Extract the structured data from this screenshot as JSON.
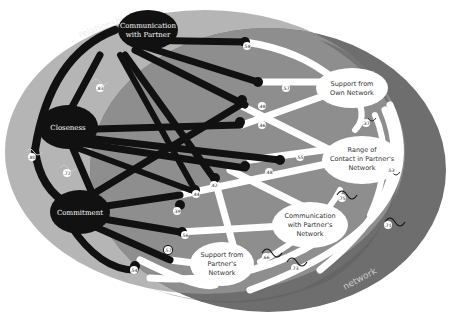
{
  "regions": {
    "relationship": {
      "label": "relationship",
      "color": "#b5b5b5"
    },
    "network": {
      "label": "network",
      "color": "#6e6e6e"
    },
    "overlap_color": "#8e8e8e"
  },
  "colors": {
    "relationship_link": "#111111",
    "network_link": "#ffffff",
    "background": "#ffffff"
  },
  "relationship_nodes": [
    {
      "id": "comm_partner",
      "label_lines": [
        "Communication",
        "with Partner"
      ]
    },
    {
      "id": "closeness",
      "label_lines": [
        "Closeness"
      ]
    },
    {
      "id": "commitment",
      "label_lines": [
        "Commitment"
      ]
    }
  ],
  "network_nodes": [
    {
      "id": "support_own",
      "label_lines": [
        "Support from",
        "Own Network"
      ]
    },
    {
      "id": "range_contact",
      "label_lines": [
        "Range of",
        "Contact in Partner's",
        "Network"
      ]
    },
    {
      "id": "comm_network",
      "label_lines": [
        "Communication",
        "with Partner's",
        "Network"
      ]
    },
    {
      "id": "support_partner",
      "label_lines": [
        "Support from",
        "Partner's",
        "Network"
      ]
    }
  ],
  "cross_correlations": [
    {
      "from": "comm_partner",
      "to": "support_own",
      "value": ".58"
    },
    {
      "from": "comm_partner",
      "to": "range_contact",
      "value": ".48"
    },
    {
      "from": "comm_partner",
      "to": "comm_network",
      "value": ".42"
    },
    {
      "from": "comm_partner",
      "to": "support_partner",
      "value": ".44"
    },
    {
      "from": "closeness",
      "to": "support_own",
      "value": ".57"
    },
    {
      "from": "closeness",
      "to": "range_contact",
      "value": ".55"
    },
    {
      "from": "closeness",
      "to": "comm_network",
      "value": ".48"
    },
    {
      "from": "closeness",
      "to": "support_partner",
      "value": ".46"
    },
    {
      "from": "commitment",
      "to": "support_own",
      "value": ".39"
    },
    {
      "from": "commitment",
      "to": "range_contact",
      "value": ".56"
    },
    {
      "from": "commitment",
      "to": "comm_network",
      "value": ".57"
    },
    {
      "from": "commitment",
      "to": "support_partner",
      "value": ".54"
    }
  ],
  "within_relationship": [
    {
      "from": "comm_partner",
      "to": "closeness",
      "value": ".83"
    },
    {
      "from": "comm_partner",
      "to": "commitment",
      "value": ".80"
    },
    {
      "from": "closeness",
      "to": "commitment",
      "value": ".72"
    }
  ],
  "within_network": [
    {
      "from": "support_own",
      "to": "range_contact",
      "value": ".37"
    },
    {
      "from": "support_own",
      "to": "comm_network",
      "value": ".53"
    },
    {
      "from": "range_contact",
      "to": "comm_network",
      "value": ".75"
    },
    {
      "from": "support_own",
      "to": "support_partner",
      "value": ".71"
    },
    {
      "from": "comm_network",
      "to": "support_partner",
      "value": ".66"
    },
    {
      "from": "range_contact",
      "to": "support_partner",
      "value": ".73"
    }
  ],
  "badges": {
    "b1": ".58",
    "b2": ".57",
    "b3": ".48",
    "b4": ".46",
    "b5": ".55",
    "b6": ".48",
    "b7": ".42",
    "b8": ".44",
    "b9": ".39",
    "b10": ".56",
    "b11": ".57",
    "b12": ".54",
    "b13": ".83",
    "b14": ".80",
    "b15": ".72",
    "b16": ".37",
    "b17": ".53",
    "b18": ".75",
    "b19": ".71",
    "b20": ".66",
    "b21": ".73"
  }
}
